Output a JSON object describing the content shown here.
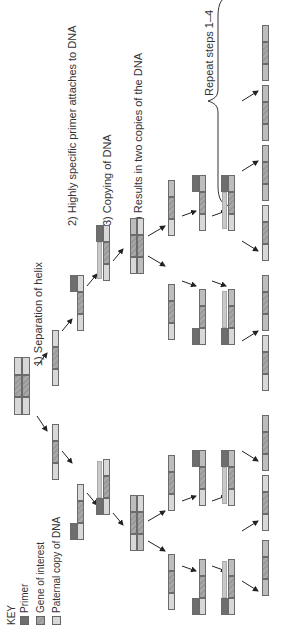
{
  "orientation": "rotated 90 degrees counterclockwise",
  "key": {
    "title": "KEY",
    "items": [
      {
        "label": "Primer",
        "color": "#6e6e6e"
      },
      {
        "label": "Gene of interest",
        "color": "#9a9a9a"
      },
      {
        "label": "Paternal copy of DNA",
        "color": "#d8d8d8"
      }
    ]
  },
  "steps": [
    {
      "label": "1) Separation of helix"
    },
    {
      "label": "2) Highly specific primer attaches to DNA"
    },
    {
      "label": "3) Copying of DNA"
    },
    {
      "label": "4) Results in two copies of the DNA"
    }
  ],
  "repeat": {
    "label": "Repeat steps 1–4"
  },
  "colors": {
    "primer": "#6e6e6e",
    "gene": "#9a9a9a",
    "paternal": "#d8d8d8",
    "copy_arrow": "#c0c0c0",
    "arrow": "#222222"
  }
}
